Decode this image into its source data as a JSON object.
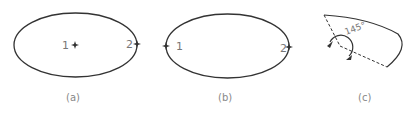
{
  "figure": {
    "panels": [
      {
        "caption": "(a)",
        "ellipse": {
          "cx": 75.5,
          "cy": 45,
          "rx": 61.5,
          "ry": 32
        },
        "points": [
          {
            "label": "1",
            "x": 75,
            "y": 45
          },
          {
            "label": "2",
            "x": 137,
            "y": 44
          }
        ]
      },
      {
        "caption": "(b)",
        "ellipse": {
          "cx": 227.5,
          "cy": 46,
          "rx": 61.5,
          "ry": 32
        },
        "points": [
          {
            "label": "1",
            "x": 166,
            "y": 46
          },
          {
            "label": "2",
            "x": 289,
            "y": 47
          }
        ]
      },
      {
        "caption": "(c)",
        "angle_label": "145°"
      }
    ],
    "colors": {
      "stroke": "#333333",
      "label": "#777777"
    }
  }
}
